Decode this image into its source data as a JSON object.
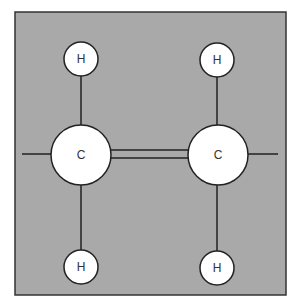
{
  "diagram": {
    "type": "molecule-structure",
    "colors": {
      "background": "#a9a9a9",
      "frame": "#333333",
      "atom_fill": "#ffffff",
      "bond": "#222222",
      "label": "#333333"
    },
    "atoms": [
      {
        "id": "C1",
        "label": "C",
        "cx": 81,
        "cy": 155,
        "r": 30
      },
      {
        "id": "C2",
        "label": "C",
        "cx": 218,
        "cy": 155,
        "r": 30
      },
      {
        "id": "H1",
        "label": "H",
        "cx": 81,
        "cy": 59,
        "r": 17
      },
      {
        "id": "H2",
        "label": "H",
        "cx": 217,
        "cy": 60,
        "r": 17
      },
      {
        "id": "H3",
        "label": "H",
        "cx": 81,
        "cy": 267,
        "r": 17
      },
      {
        "id": "H4",
        "label": "H",
        "cx": 217,
        "cy": 268,
        "r": 17
      }
    ],
    "bonds": [
      {
        "from": "C1",
        "to": "C2",
        "order": 2
      },
      {
        "from": "C1",
        "to": "H1",
        "order": 1
      },
      {
        "from": "C1",
        "to": "H3",
        "order": 1
      },
      {
        "from": "C2",
        "to": "H2",
        "order": 1
      },
      {
        "from": "C2",
        "to": "H4",
        "order": 1
      }
    ],
    "labels": {
      "c_left": "C",
      "c_right": "C",
      "h_top_left": "H",
      "h_top_right": "H",
      "h_bottom_left": "H",
      "h_bottom_right": "H"
    }
  }
}
